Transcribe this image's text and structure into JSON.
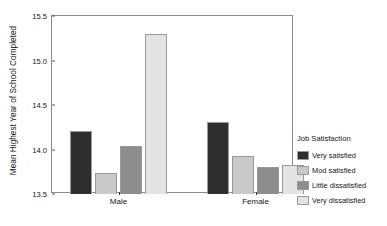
{
  "chart_data": {
    "type": "bar",
    "title": "",
    "xlabel": "",
    "ylabel": "Mean Highest Year of School Completed",
    "ylim": [
      13.5,
      15.5
    ],
    "yticks": [
      "13.5",
      "14.0",
      "14.5",
      "15.0",
      "15.5"
    ],
    "ytick_values": [
      13.5,
      14.0,
      14.5,
      15.0,
      15.5
    ],
    "categories": [
      "Male",
      "Female"
    ],
    "grid": false,
    "legend_position": "right",
    "legend_title": "Job Satisfaction",
    "series": [
      {
        "name": "Very satisfied",
        "color": "#2e2e2e",
        "values": [
          14.21,
          14.31
        ]
      },
      {
        "name": "Mod satisfied",
        "color": "#c9c9c9",
        "values": [
          13.74,
          13.93
        ]
      },
      {
        "name": "Little dissatisfied",
        "color": "#8d8d8d",
        "values": [
          14.04,
          13.8
        ]
      },
      {
        "name": "Very dissatisfied",
        "color": "#e3e3e3",
        "values": [
          15.3,
          13.83
        ]
      }
    ]
  }
}
